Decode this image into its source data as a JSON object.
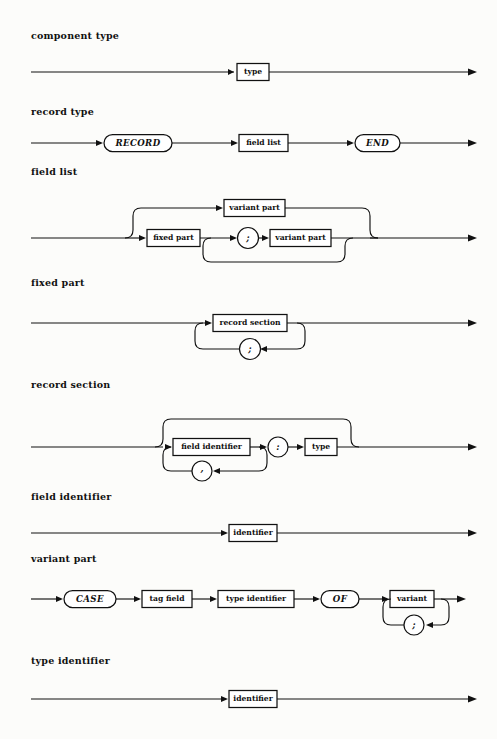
{
  "document": {
    "kind": "railroad-syntax-diagram",
    "notation": "Pascal record type syntax diagrams",
    "ink_color": "#111111",
    "paper_color": "#fcfcfa"
  },
  "sections": [
    {
      "id": "component-type",
      "label": "component type",
      "label_y": 36,
      "diagram_top": 55,
      "diagram_height": 34,
      "nodes": [
        {
          "type": "nonterminal",
          "text": "type"
        }
      ]
    },
    {
      "id": "record-type",
      "label": "record type",
      "label_y": 112,
      "diagram_top": 128,
      "diagram_height": 30,
      "nodes": [
        {
          "type": "keyword",
          "text": "RECORD"
        },
        {
          "type": "nonterminal",
          "text": "field list"
        },
        {
          "type": "keyword",
          "text": "END"
        }
      ]
    },
    {
      "id": "field-list",
      "label": "field list",
      "label_y": 172,
      "diagram_top": 192,
      "diagram_height": 78,
      "nodes": [
        {
          "type": "nonterminal",
          "text": "variant part"
        },
        {
          "type": "nonterminal",
          "text": "fixed part"
        },
        {
          "type": "punct",
          "text": ";"
        },
        {
          "type": "nonterminal",
          "text": "variant part"
        }
      ]
    },
    {
      "id": "fixed-part",
      "label": "fixed part",
      "label_y": 283,
      "diagram_top": 308,
      "diagram_height": 62,
      "nodes": [
        {
          "type": "nonterminal",
          "text": "record section"
        },
        {
          "type": "punct",
          "text": ";"
        }
      ]
    },
    {
      "id": "record-section",
      "label": "record section",
      "label_y": 385,
      "diagram_top": 405,
      "diagram_height": 78,
      "nodes": [
        {
          "type": "nonterminal",
          "text": "field identifier"
        },
        {
          "type": "punct",
          "text": ","
        },
        {
          "type": "punct",
          "text": ":"
        },
        {
          "type": "nonterminal",
          "text": "type"
        }
      ]
    },
    {
      "id": "field-identifier",
      "label": "field identifier",
      "label_y": 497,
      "diagram_top": 518,
      "diagram_height": 30,
      "nodes": [
        {
          "type": "nonterminal",
          "text": "identifier"
        }
      ]
    },
    {
      "id": "variant-part",
      "label": "variant part",
      "label_y": 559,
      "diagram_top": 585,
      "diagram_height": 58,
      "nodes": [
        {
          "type": "keyword",
          "text": "CASE"
        },
        {
          "type": "nonterminal",
          "text": "tag field"
        },
        {
          "type": "nonterminal",
          "text": "type identifier"
        },
        {
          "type": "keyword",
          "text": "OF"
        },
        {
          "type": "nonterminal",
          "text": "variant"
        },
        {
          "type": "punct",
          "text": ";"
        }
      ]
    },
    {
      "id": "type-identifier",
      "label": "type identifier",
      "label_y": 661,
      "diagram_top": 684,
      "diagram_height": 30,
      "nodes": [
        {
          "type": "nonterminal",
          "text": "identifier"
        }
      ]
    }
  ],
  "labels": {
    "component_type": "component type",
    "record_type": "record type",
    "field_list": "field list",
    "fixed_part": "fixed part",
    "record_section": "record section",
    "field_identifier": "field identifier",
    "variant_part": "variant part",
    "type_identifier": "type identifier"
  },
  "tokens": {
    "type": "type",
    "record_kw": "RECORD",
    "end_kw": "END",
    "case_kw": "CASE",
    "of_kw": "OF",
    "field_list": "field list",
    "variant_part": "variant part",
    "fixed_part": "fixed part",
    "record_section": "record section",
    "field_identifier": "field identifier",
    "tag_field": "tag field",
    "type_identifier": "type identifier",
    "variant": "variant",
    "identifier": "identifier",
    "semicolon": ";",
    "comma": ",",
    "colon": ":"
  }
}
